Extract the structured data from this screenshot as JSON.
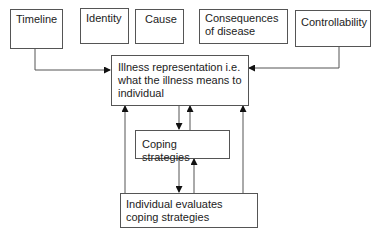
{
  "diagram": {
    "top_boxes": [
      {
        "id": "timeline",
        "label": "Timeline"
      },
      {
        "id": "identity",
        "label": "Identity"
      },
      {
        "id": "cause",
        "label": "Cause"
      },
      {
        "id": "consequences",
        "label": "Consequences of disease"
      },
      {
        "id": "controllability",
        "label": "Controllability"
      }
    ],
    "illness_representation": {
      "label": "Illness representation i.e. what the illness means to individual"
    },
    "coping_strategies": {
      "label": "Coping strategies"
    },
    "evaluation": {
      "label": "Individual evaluates coping strategies"
    },
    "edges": [
      {
        "from": "timeline",
        "to": "illness_representation"
      },
      {
        "from": "controllability",
        "to": "illness_representation"
      },
      {
        "from": "illness_representation",
        "to": "coping_strategies"
      },
      {
        "from": "coping_strategies",
        "to": "illness_representation"
      },
      {
        "from": "coping_strategies",
        "to": "evaluation"
      },
      {
        "from": "evaluation",
        "to": "coping_strategies"
      },
      {
        "from": "evaluation",
        "to": "illness_representation"
      },
      {
        "from": "evaluation",
        "to": "illness_representation"
      }
    ]
  }
}
